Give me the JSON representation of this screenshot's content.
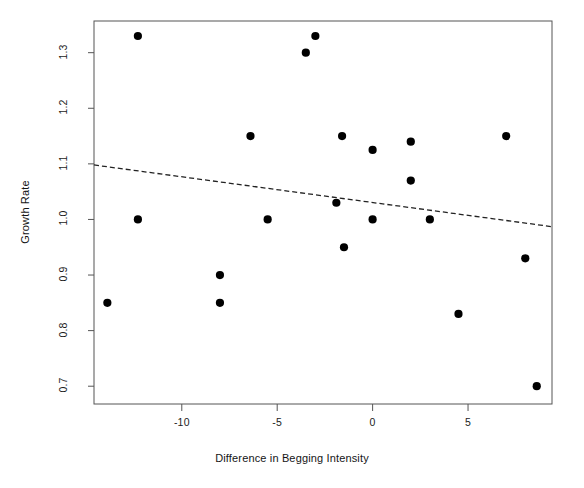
{
  "chart_data": {
    "type": "scatter",
    "title": "",
    "xlabel": "Difference in Begging Intensity",
    "ylabel": "Growth Rate",
    "xlim": [
      -14.6,
      9.4
    ],
    "ylim": [
      0.668,
      1.357
    ],
    "xticks": [
      -10,
      -5,
      0,
      5
    ],
    "xtick_labels": [
      "-10",
      "-5",
      "0",
      "5"
    ],
    "yticks": [
      0.7,
      0.8,
      0.9,
      1.0,
      1.1,
      1.2,
      1.3
    ],
    "ytick_labels": [
      "0.7",
      "0.8",
      "0.9",
      "1.0",
      "1.1",
      "1.2",
      "1.3"
    ],
    "grid": false,
    "legend": null,
    "marker": "filled-circle",
    "marker_color": "#000000",
    "points": [
      {
        "x": -13.9,
        "y": 0.85
      },
      {
        "x": -12.3,
        "y": 1.33
      },
      {
        "x": -12.3,
        "y": 1.0
      },
      {
        "x": -8.0,
        "y": 0.9
      },
      {
        "x": -8.0,
        "y": 0.85
      },
      {
        "x": -6.4,
        "y": 1.15
      },
      {
        "x": -5.5,
        "y": 1.0
      },
      {
        "x": -3.5,
        "y": 1.3
      },
      {
        "x": -3.0,
        "y": 1.33
      },
      {
        "x": -1.9,
        "y": 1.03
      },
      {
        "x": -1.6,
        "y": 1.15
      },
      {
        "x": -1.5,
        "y": 0.95
      },
      {
        "x": 0.0,
        "y": 1.125
      },
      {
        "x": 0.0,
        "y": 1.0
      },
      {
        "x": 2.0,
        "y": 1.14
      },
      {
        "x": 2.0,
        "y": 1.07
      },
      {
        "x": 3.0,
        "y": 1.0
      },
      {
        "x": 4.5,
        "y": 0.83
      },
      {
        "x": 7.0,
        "y": 1.15
      },
      {
        "x": 8.0,
        "y": 0.93
      },
      {
        "x": 8.6,
        "y": 0.7
      }
    ],
    "fit_line": {
      "style": "dashed",
      "color": "#222222",
      "x_start": -14.6,
      "y_start": 1.098,
      "x_end": 9.4,
      "y_end": 0.987
    },
    "frame": {
      "color": "#555555",
      "box": true
    }
  }
}
